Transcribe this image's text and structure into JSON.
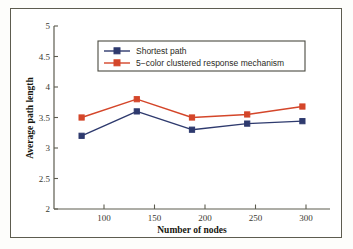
{
  "chart_data": {
    "type": "line",
    "title": "",
    "xlabel": "Number of nodes",
    "ylabel": "Average path length",
    "categories": [
      100,
      150,
      200,
      250,
      300
    ],
    "x": [
      100,
      150,
      200,
      250,
      300
    ],
    "xlim": [
      75,
      325
    ],
    "ylim": [
      2,
      5
    ],
    "xticks": [
      "100",
      "150",
      "200",
      "250",
      "300"
    ],
    "yticks": [
      "2",
      "2.5",
      "3",
      "3.5",
      "4",
      "4.5",
      "5"
    ],
    "grid": false,
    "legend_position": "upper-left-inside",
    "series": [
      {
        "name": "Shortest path",
        "color": "#2e3a6e",
        "marker": "square",
        "values": [
          3.2,
          3.6,
          3.3,
          3.4,
          3.44
        ]
      },
      {
        "name": "5−color clustered response mechanism",
        "color": "#d4462a",
        "marker": "square",
        "values": [
          3.5,
          3.8,
          3.5,
          3.55,
          3.68
        ]
      }
    ]
  },
  "figure": {
    "frame_color": "#5d5c4f",
    "background": "#ffffff"
  }
}
